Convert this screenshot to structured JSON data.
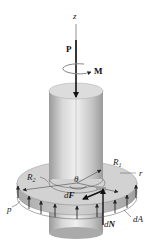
{
  "figure": {
    "labels": {
      "z_axis": "z",
      "force": "P",
      "moment": "M",
      "inner_radius": "R",
      "inner_radius_sub": "1",
      "outer_radius": "R",
      "outer_radius_sub": "2",
      "radius": "r",
      "angle": "θ",
      "friction_force_d": "d",
      "friction_force": "F",
      "normal_force_d": "d",
      "normal_force": "N",
      "area_element": "dA",
      "pressure": "p"
    },
    "colors": {
      "shaft_light": "#e6e6e6",
      "shaft_dark": "#9a9a9a",
      "collar_top": "#cfcfcf",
      "collar_side": "#b5b5b5",
      "arrow": "#111111",
      "dim_line": "#333333"
    }
  }
}
